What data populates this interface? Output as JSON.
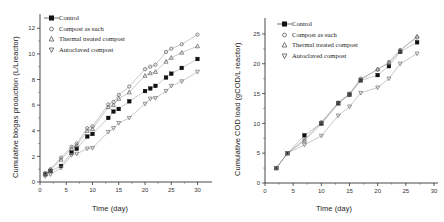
{
  "figure": {
    "panels": [
      "biogas",
      "cod"
    ]
  },
  "legend": {
    "entries": [
      {
        "label": "Control",
        "marker": "filled-square-icon",
        "color": "#111111"
      },
      {
        "label": "Compost as such",
        "marker": "open-circle-icon",
        "color": "#555555"
      },
      {
        "label": "Thermal treated compost",
        "marker": "triangle-up-icon",
        "color": "#555555"
      },
      {
        "label": "Autoclaved compost",
        "marker": "triangle-down-icon",
        "color": "#555555"
      }
    ]
  },
  "chart_data": [
    {
      "id": "biogas",
      "type": "scatter",
      "title": "",
      "xlabel": "Time (day)",
      "ylabel": "Cumulative biogas production (L/Lreactor)",
      "xlim": [
        0,
        32
      ],
      "ylim": [
        0,
        12.8
      ],
      "xticks": [
        0,
        5,
        10,
        15,
        20,
        25,
        30
      ],
      "yticks": [
        0,
        2,
        4,
        6,
        8,
        10,
        12
      ],
      "grid": false,
      "legend_position": "top-left",
      "series": [
        {
          "name": "Control",
          "marker": "filled-square",
          "color": "#111111",
          "line": true,
          "x": [
            1,
            2,
            4,
            6,
            7,
            9,
            10,
            13,
            14,
            15,
            17,
            20,
            21,
            22,
            24,
            25,
            27,
            30
          ],
          "y": [
            0.6,
            0.85,
            1.25,
            2.3,
            2.6,
            3.55,
            3.75,
            5.0,
            5.5,
            5.7,
            6.3,
            7.1,
            7.3,
            7.5,
            8.15,
            8.45,
            8.9,
            9.6
          ]
        },
        {
          "name": "Compost as such",
          "marker": "open-circle",
          "color": "#666666",
          "line": true,
          "x": [
            1,
            2,
            4,
            6,
            7,
            9,
            10,
            13,
            14,
            15,
            17,
            20,
            21,
            22,
            24,
            25,
            27,
            30
          ],
          "y": [
            0.7,
            1.0,
            1.9,
            2.75,
            3.0,
            4.2,
            4.35,
            6.05,
            6.25,
            6.8,
            7.45,
            8.8,
            9.0,
            9.15,
            10.15,
            10.4,
            10.75,
            11.5
          ]
        },
        {
          "name": "Thermal treated compost",
          "marker": "triangle-up",
          "color": "#666666",
          "line": true,
          "x": [
            1,
            2,
            4,
            6,
            7,
            9,
            10,
            13,
            14,
            15,
            17,
            20,
            21,
            22,
            24,
            25,
            27,
            30
          ],
          "y": [
            0.65,
            0.95,
            1.75,
            2.6,
            2.85,
            4.0,
            4.15,
            5.85,
            6.0,
            6.5,
            7.0,
            8.3,
            8.5,
            8.6,
            9.4,
            9.7,
            10.1,
            10.6
          ]
        },
        {
          "name": "Autoclaved compost",
          "marker": "triangle-down",
          "color": "#777777",
          "line": true,
          "x": [
            1,
            2,
            4,
            6,
            7,
            9,
            10,
            13,
            14,
            15,
            17,
            20,
            21,
            22,
            24,
            25,
            27,
            30
          ],
          "y": [
            0.45,
            0.6,
            1.1,
            2.1,
            2.2,
            2.6,
            2.65,
            3.9,
            4.2,
            4.6,
            5.0,
            6.1,
            6.5,
            6.55,
            7.1,
            7.5,
            7.85,
            8.6
          ]
        }
      ]
    },
    {
      "id": "cod",
      "type": "scatter",
      "title": "",
      "xlabel": "Time (day)",
      "ylabel": "Cumulative COD load (gCOD/L reactor)",
      "xlim": [
        0,
        30
      ],
      "ylim": [
        0,
        27
      ],
      "xticks": [
        0,
        5,
        10,
        15,
        20,
        25,
        30
      ],
      "yticks": [
        0,
        5,
        10,
        15,
        20,
        25
      ],
      "grid": false,
      "legend_position": "top-left",
      "series": [
        {
          "name": "Control",
          "marker": "filled-square",
          "color": "#111111",
          "line": true,
          "x": [
            2,
            4,
            7,
            10,
            13,
            15,
            17,
            20,
            22,
            24,
            27
          ],
          "y": [
            2.5,
            5.0,
            8.0,
            10.0,
            13.4,
            14.8,
            17.2,
            18.1,
            19.6,
            22.0,
            23.6
          ]
        },
        {
          "name": "Compost as such",
          "marker": "open-circle",
          "color": "#666666",
          "line": true,
          "x": [
            2,
            4,
            7,
            10,
            13,
            15,
            17,
            20,
            22,
            24,
            27
          ],
          "y": [
            2.5,
            5.0,
            7.3,
            10.2,
            13.5,
            15.0,
            17.5,
            19.0,
            20.3,
            22.3,
            24.4
          ]
        },
        {
          "name": "Thermal treated compost",
          "marker": "triangle-up",
          "color": "#666666",
          "line": true,
          "x": [
            2,
            4,
            7,
            10,
            13,
            15,
            17,
            20,
            22,
            24,
            27
          ],
          "y": [
            2.5,
            5.0,
            7.1,
            9.9,
            13.3,
            14.9,
            17.3,
            19.1,
            20.1,
            22.2,
            24.6
          ]
        },
        {
          "name": "Autoclaved compost",
          "marker": "triangle-down",
          "color": "#777777",
          "line": true,
          "x": [
            2,
            4,
            7,
            10,
            13,
            15,
            17,
            20,
            22,
            24,
            27
          ],
          "y": [
            2.5,
            5.0,
            6.4,
            7.9,
            11.3,
            12.8,
            15.1,
            16.0,
            17.5,
            20.0,
            21.7
          ]
        }
      ]
    }
  ]
}
